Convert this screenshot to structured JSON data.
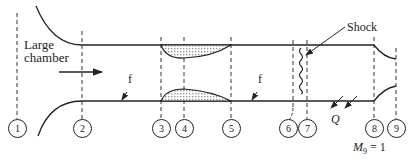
{
  "diagram": {
    "labels": {
      "chamber_line1": "Large",
      "chamber_line2": "chamber",
      "shock": "Shock",
      "friction_left": "f",
      "friction_right": "f",
      "heat": "Q",
      "exit_mach": "M",
      "exit_mach_sub": "9",
      "exit_mach_value": " = 1"
    },
    "stations": [
      {
        "id": "1",
        "x": 17
      },
      {
        "id": "2",
        "x": 82
      },
      {
        "id": "3",
        "x": 161
      },
      {
        "id": "4",
        "x": 184
      },
      {
        "id": "5",
        "x": 231
      },
      {
        "id": "6",
        "x": 291
      },
      {
        "id": "7",
        "x": 307
      },
      {
        "id": "8",
        "x": 374
      },
      {
        "id": "9",
        "x": 396
      }
    ],
    "colors": {
      "line": "#222222",
      "hatch": "#bbbbbb",
      "background": "#ffffff"
    }
  }
}
